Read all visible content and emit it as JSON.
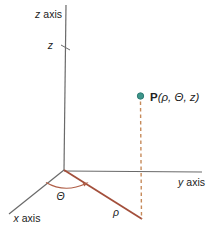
{
  "labels": {
    "z_axis": {
      "var": "z",
      "word": "axis"
    },
    "y_axis": {
      "var": "y",
      "word": "axis"
    },
    "x_axis": {
      "var": "x",
      "word": "axis"
    },
    "z_tick": "z",
    "theta": "Θ",
    "rho": "ρ",
    "point": {
      "name": "P",
      "args": "(ρ, Θ, z)"
    }
  },
  "colors": {
    "background": "#ffffff",
    "text": "#222222",
    "axis": "#6a6a6a",
    "rho_line": "#a34f3b",
    "dashed_line": "#c68a5a",
    "angle_arc": "#b05f48",
    "point_dot": "#3e968b",
    "point_dot_edge": "#2f7d74"
  }
}
